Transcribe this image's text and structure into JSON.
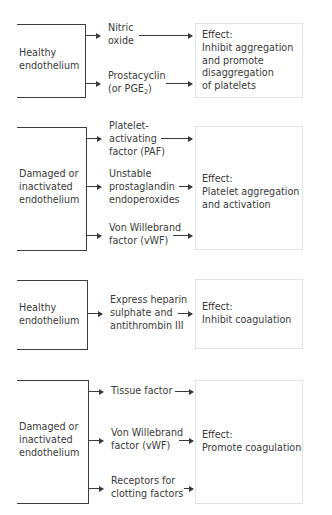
{
  "diagram": {
    "panels": [
      {
        "source": "Healthy\nendothelium",
        "mediators": [
          {
            "label": "Nitric\noxide"
          },
          {
            "label_main": "Prostacyclin\n(or PGE",
            "label_sub": "2",
            "label_end": ")"
          }
        ],
        "effect": "Effect:\nInhibit aggregation\nand promote\ndisaggregation\nof platelets"
      },
      {
        "source": "Damaged or\ninactivated\nendothelium",
        "mediators": [
          {
            "label": "Platelet-\nactivating\nfactor (PAF)"
          },
          {
            "label": "Unstable\nprostaglandin\nendoperoxides"
          },
          {
            "label": "Von Willebrand\nfactor (vWF)"
          }
        ],
        "effect": "Effect:\nPlatelet aggregation\nand activation"
      },
      {
        "source": "Healthy\nendothelium",
        "mediators": [
          {
            "label": "Express heparin\nsulphate and\nantithrombin III"
          }
        ],
        "effect": "Effect:\nInhibit coagulation"
      },
      {
        "source": "Damaged or\ninactivated\nendothelium",
        "mediators": [
          {
            "label": "Tissue factor"
          },
          {
            "label": "Von Willebrand\nfactor (vWF)"
          },
          {
            "label": "Receptors for\nclotting factors"
          }
        ],
        "effect": "Effect:\nPromote coagulation"
      }
    ],
    "colors": {
      "line": "#3d3d3d",
      "text": "#3a3a3a",
      "effect_border": "#e4e4e4",
      "background": "#ffffff"
    }
  }
}
